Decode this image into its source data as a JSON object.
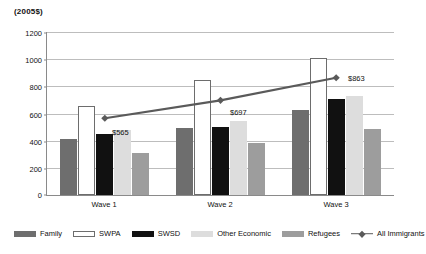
{
  "chart_data": {
    "type": "bar",
    "title": "",
    "subtitle": "",
    "xlabel": "",
    "ylabel": "(2005$)",
    "categories": [
      "Wave 1",
      "Wave 2",
      "Wave 3"
    ],
    "ylim": [
      0,
      1200
    ],
    "yticks": [
      0,
      200,
      400,
      600,
      800,
      1000,
      1200
    ],
    "ytick_labels": [
      "0",
      "200",
      "400",
      "600",
      "800",
      "1000",
      "1200"
    ],
    "grid": true,
    "legend_position": "bottom",
    "series": [
      {
        "name": "Family",
        "type": "bar",
        "color": "#6e6e6e",
        "values": [
          410,
          495,
          625
        ]
      },
      {
        "name": "SWPA",
        "type": "bar",
        "color": "#ffffff",
        "values": [
          655,
          850,
          1010
        ]
      },
      {
        "name": "SWSD",
        "type": "bar",
        "color": "#111111",
        "values": [
          450,
          500,
          705
        ]
      },
      {
        "name": "Other Economic",
        "type": "bar",
        "color": "#dddddd",
        "values": [
          475,
          545,
          730
        ]
      },
      {
        "name": "Refugees",
        "type": "bar",
        "color": "#9d9d9d",
        "values": [
          310,
          380,
          485
        ]
      },
      {
        "name": "All Immigrants",
        "type": "line",
        "color": "#5a5a5a",
        "values": [
          565,
          697,
          863
        ],
        "data_labels": [
          "$565",
          "$697",
          "$863"
        ]
      }
    ]
  },
  "axis": {
    "y_title": "(2005$)",
    "tick_labels": [
      "1200",
      "1000",
      "800",
      "600",
      "400",
      "200",
      "0"
    ]
  },
  "xaxis": {
    "labels": [
      "Wave 1",
      "Wave 2",
      "Wave 3"
    ]
  },
  "legend": {
    "items": [
      {
        "label": "Family",
        "swatch": "family-swatch"
      },
      {
        "label": "SWPA",
        "swatch": "swpa-swatch"
      },
      {
        "label": "SWSD",
        "swatch": "swsd-swatch"
      },
      {
        "label": "Other Economic",
        "swatch": "other-economic-swatch"
      },
      {
        "label": "Refugees",
        "swatch": "refugees-swatch"
      },
      {
        "label": "All Immigrants",
        "swatch": "all-immigrants-line-swatch"
      }
    ]
  },
  "labels": {
    "point_1": "$565",
    "point_2": "$697",
    "point_3": "$863"
  }
}
